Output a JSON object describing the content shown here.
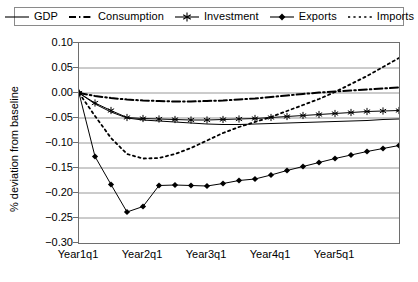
{
  "chart_data": {
    "type": "line",
    "title": "",
    "xlabel": "",
    "ylabel": "% deviation from baseline",
    "ylim": [
      -0.3,
      0.1
    ],
    "ytick_values": [
      0.1,
      0.05,
      0.0,
      -0.05,
      -0.1,
      -0.15,
      -0.2,
      -0.25,
      -0.3
    ],
    "ytick_labels": [
      "0.10",
      "0.05",
      "0.00",
      "-0.05",
      "-0.10",
      "-0.15",
      "-0.20",
      "-0.25",
      "-0.30"
    ],
    "grid": true,
    "legend_position": "top",
    "x_count": 21,
    "xtick_positions": [
      0,
      4,
      8,
      12,
      16
    ],
    "categories": [
      "Year1q1",
      "Year1q2",
      "Year1q3",
      "Year1q4",
      "Year2q1",
      "Year2q2",
      "Year2q3",
      "Year2q4",
      "Year3q1",
      "Year3q2",
      "Year3q3",
      "Year3q4",
      "Year4q1",
      "Year4q2",
      "Year4q3",
      "Year4q4",
      "Year5q1",
      "Year5q2",
      "Year5q3",
      "Year5q4",
      "Year6q1"
    ],
    "xtick_labels": [
      "Year1q1",
      "Year2q1",
      "Year3q1",
      "Year4q1",
      "Year5q1"
    ],
    "series": [
      {
        "name": "GDP",
        "style": "solid",
        "marker": "none",
        "color": "#000000",
        "values": [
          0.0,
          -0.022,
          -0.038,
          -0.05,
          -0.054,
          -0.056,
          -0.058,
          -0.06,
          -0.062,
          -0.063,
          -0.063,
          -0.062,
          -0.061,
          -0.06,
          -0.059,
          -0.058,
          -0.057,
          -0.056,
          -0.055,
          -0.053,
          -0.052
        ]
      },
      {
        "name": "Consumption",
        "style": "dashdot",
        "marker": "none",
        "color": "#000000",
        "values": [
          0.0,
          -0.006,
          -0.01,
          -0.013,
          -0.015,
          -0.016,
          -0.017,
          -0.017,
          -0.016,
          -0.015,
          -0.013,
          -0.011,
          -0.008,
          -0.005,
          -0.002,
          0.001,
          0.003,
          0.005,
          0.007,
          0.009,
          0.011
        ]
      },
      {
        "name": "Investment",
        "style": "solid",
        "marker": "asterisk",
        "color": "#000000",
        "values": [
          0.0,
          -0.02,
          -0.035,
          -0.049,
          -0.051,
          -0.052,
          -0.053,
          -0.054,
          -0.054,
          -0.053,
          -0.052,
          -0.051,
          -0.049,
          -0.047,
          -0.045,
          -0.043,
          -0.041,
          -0.039,
          -0.037,
          -0.036,
          -0.035
        ]
      },
      {
        "name": "Exports",
        "style": "solid",
        "marker": "diamond",
        "color": "#000000",
        "values": [
          0.0,
          -0.127,
          -0.183,
          -0.238,
          -0.227,
          -0.185,
          -0.184,
          -0.185,
          -0.186,
          -0.181,
          -0.175,
          -0.172,
          -0.164,
          -0.155,
          -0.147,
          -0.139,
          -0.131,
          -0.124,
          -0.117,
          -0.111,
          -0.105
        ]
      },
      {
        "name": "Imports",
        "style": "dotted",
        "marker": "none",
        "color": "#000000",
        "values": [
          0.0,
          -0.046,
          -0.09,
          -0.122,
          -0.131,
          -0.13,
          -0.122,
          -0.11,
          -0.095,
          -0.08,
          -0.068,
          -0.058,
          -0.048,
          -0.036,
          -0.024,
          -0.012,
          0.002,
          0.018,
          0.034,
          0.052,
          0.07
        ]
      }
    ]
  },
  "legend": {
    "items": [
      {
        "label": "GDP",
        "swatch": "line-solid-swatch"
      },
      {
        "label": "Consumption",
        "swatch": "line-dashdot-swatch"
      },
      {
        "label": "Investment",
        "swatch": "line-asterisk-swatch"
      },
      {
        "label": "Exports",
        "swatch": "line-diamond-swatch"
      },
      {
        "label": "Imports",
        "swatch": "line-dotted-swatch"
      }
    ]
  }
}
